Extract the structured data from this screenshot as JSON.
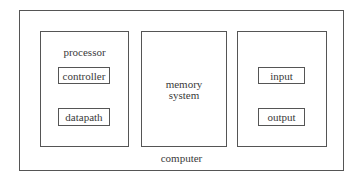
{
  "diagram": {
    "type": "block-diagram",
    "outer": {
      "label": "computer"
    },
    "processor": {
      "label": "processor",
      "components": [
        {
          "label": "controller"
        },
        {
          "label": "datapath"
        }
      ]
    },
    "memory": {
      "label_line1": "memory",
      "label_line2": "system"
    },
    "io": {
      "components": [
        {
          "label": "input"
        },
        {
          "label": "output"
        }
      ]
    },
    "colors": {
      "border": "#555555",
      "text": "#3a3a3a",
      "background": "#ffffff"
    }
  }
}
